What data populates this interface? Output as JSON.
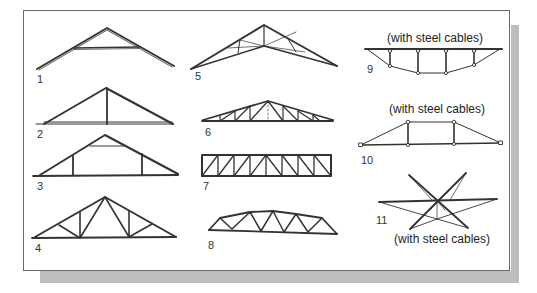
{
  "figure": {
    "title": "",
    "colors": {
      "line": "#333333",
      "frame_border": "#6a6a6a",
      "shadow": "#bdbdbd",
      "background": "#ffffff"
    },
    "trusses": [
      {
        "id": 1,
        "label": "1",
        "type": "collar-tie truss"
      },
      {
        "id": 2,
        "label": "2",
        "type": "king post truss"
      },
      {
        "id": 3,
        "label": "3",
        "type": "queen post truss"
      },
      {
        "id": 4,
        "label": "4",
        "type": "fink / W truss with verticals"
      },
      {
        "id": 5,
        "label": "5",
        "type": "scissor truss"
      },
      {
        "id": 6,
        "label": "6",
        "type": "Pratt pitched truss"
      },
      {
        "id": 7,
        "label": "7",
        "type": "flat Pratt truss"
      },
      {
        "id": 8,
        "label": "8",
        "type": "bowstring Warren truss"
      },
      {
        "id": 9,
        "label": "9",
        "type": "cable-stayed underslung truss",
        "caption": "(with steel cables)"
      },
      {
        "id": 10,
        "label": "10",
        "type": "cable trapezoidal truss",
        "caption": "(with steel cables)"
      },
      {
        "id": 11,
        "label": "11",
        "type": "cable star truss",
        "caption": "(with steel cables)"
      }
    ]
  }
}
